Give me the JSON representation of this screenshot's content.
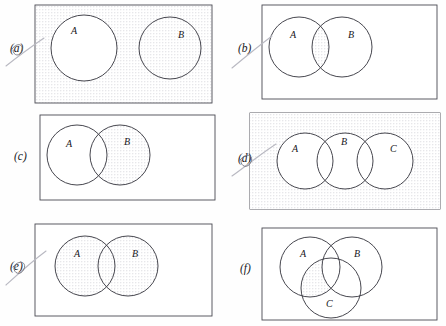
{
  "figure": {
    "width": 446,
    "height": 326,
    "shading_style": "fine gray dot stipple",
    "colors": {
      "page_background": "#fefefe",
      "frame_stroke": "#4a4a52",
      "circle_stroke": "#3c3c44",
      "shade_dot": "#9a9aa6",
      "label_text": "#17171c",
      "pen_mark": "#b9b9c2"
    }
  },
  "panels": [
    {
      "id": "a",
      "label": "(a)",
      "has_pen_mark": true,
      "rect_shaded": true,
      "sets": [
        "A",
        "B"
      ],
      "set_labels": {
        "A": "A",
        "B": "B"
      },
      "layout": "two disjoint circles",
      "shaded_description": "everything outside circle A, including circle B and the rest of the rectangle",
      "set_expression": "A'"
    },
    {
      "id": "b",
      "label": "(b)",
      "has_pen_mark": true,
      "rect_shaded": false,
      "sets": [
        "A",
        "B"
      ],
      "set_labels": {
        "A": "A",
        "B": "B"
      },
      "layout": "two overlapping circles",
      "shaded_description": "only the lens where A and B overlap",
      "set_expression": "A n B"
    },
    {
      "id": "c",
      "label": "(c)",
      "has_pen_mark": false,
      "rect_shaded": false,
      "sets": [
        "A",
        "B"
      ],
      "set_labels": {
        "A": "A",
        "B": "B"
      },
      "layout": "two overlapping circles",
      "shaded_description": "the part of B that lies outside A",
      "set_expression": "B - A"
    },
    {
      "id": "d",
      "label": "(d)",
      "has_pen_mark": true,
      "rect_shaded": true,
      "sets": [
        "A",
        "B",
        "C"
      ],
      "set_labels": {
        "A": "A",
        "B": "B",
        "C": "C"
      },
      "layout": "three circles in a row, A overlaps B, B overlaps C, A and C disjoint",
      "shaded_description": "everything in the rectangle outside all three circles",
      "set_expression": "(A u B u C)'"
    },
    {
      "id": "e",
      "label": "(e)",
      "has_pen_mark": true,
      "rect_shaded": false,
      "sets": [
        "A",
        "B"
      ],
      "set_labels": {
        "A": "A",
        "B": "B"
      },
      "layout": "two overlapping circles",
      "shaded_description": "both circles entirely shaded",
      "set_expression": "A u B"
    },
    {
      "id": "f",
      "label": "(f)",
      "has_pen_mark": false,
      "rect_shaded": false,
      "sets": [
        "A",
        "B",
        "C"
      ],
      "set_labels": {
        "A": "A",
        "B": "B",
        "C": "C"
      },
      "layout": "three mutually overlapping circles, A and B on top, C below centre",
      "shaded_description": "the region common to A and C but outside B",
      "set_expression": "(A n C) - B"
    }
  ]
}
